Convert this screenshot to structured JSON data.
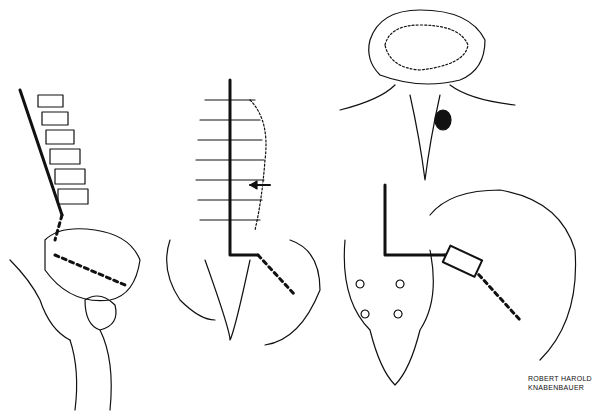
{
  "illustration": {
    "subject": "spine and pelvis line drawings",
    "panels": [
      "lateral-spine-pelvis",
      "posterior-spine-pelvis",
      "vertebra-superior-view",
      "sacrum-ilium-graft"
    ],
    "signature": {
      "line1": "ROBERT HAROLD",
      "line2": "KNABENBAUER"
    },
    "colors": {
      "ink": "#111111",
      "background": "#ffffff"
    }
  }
}
